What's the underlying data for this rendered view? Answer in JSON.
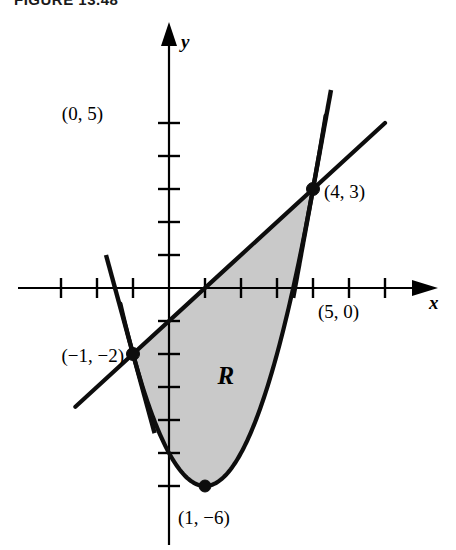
{
  "figure": {
    "caption": "FIGURE 13.48",
    "region_label": "R",
    "shade_color": "#c9c9c9",
    "ink_color": "#0d0d0d"
  },
  "axes": {
    "x_label": "x",
    "y_label": "y",
    "origin_px": [
      169,
      288
    ],
    "x_unit_px": 36,
    "y_unit_px": 33,
    "x_tick_values": [
      -3,
      -2,
      -1,
      1,
      2,
      3,
      4,
      5,
      6
    ],
    "y_tick_values": [
      1,
      2,
      3,
      4,
      5,
      -1,
      -2,
      -3,
      -4,
      -5,
      -6
    ],
    "x_arrow": true,
    "y_arrow": true,
    "grid": false
  },
  "labels": {
    "y_intercept": "(0, 5)",
    "upper_point": "(4, 3)",
    "x_intercept": "(5, 0)",
    "lower_left_point": "(−1, −2)",
    "vertex": "(1, −6)"
  },
  "chart_data": {
    "type": "line",
    "title": "FIGURE 13.48",
    "xlabel": "x",
    "ylabel": "y",
    "xlim": [
      -3.6,
      7.2
    ],
    "ylim": [
      -7.2,
      6.3
    ],
    "grid": false,
    "legend": "none",
    "series": [
      {
        "name": "parabola",
        "equation": "y = x^2 - 2x - 5",
        "vertex": [
          1,
          -6
        ],
        "x_domain": [
          -1.35,
          4.35
        ],
        "style": "solid-thick"
      },
      {
        "name": "secant-line",
        "equation": "y = x - 1",
        "through": [
          [
            -1,
            -2
          ],
          [
            4,
            3
          ]
        ],
        "slope": 1,
        "x_domain": [
          -2.6,
          6.0
        ],
        "style": "solid-thick"
      },
      {
        "name": "tangent-at-left-point",
        "equation": "y = -4x - 6",
        "tangent_at": [
          -1,
          -2
        ],
        "slope": -4,
        "x_domain": [
          -1.75,
          -0.4
        ],
        "style": "solid-thick"
      },
      {
        "name": "tangent-at-right-point",
        "equation": "y = 6x - 21",
        "tangent_at": [
          4,
          3
        ],
        "slope": 6,
        "x_domain": [
          3.45,
          4.5
        ],
        "style": "solid-thick"
      }
    ],
    "shaded_region": {
      "name": "R",
      "label": "R",
      "label_position": [
        1.35,
        -2.9
      ],
      "bounded_above_by": "y = x - 1",
      "bounded_below_by": "y = x^2 - 2x - 5",
      "x_range": [
        -1,
        4
      ],
      "fill": "#c9c9c9"
    },
    "annotations": [
      {
        "text": "(0, 5)",
        "point": [
          0,
          5
        ],
        "anchor": "left"
      },
      {
        "text": "(4, 3)",
        "point": [
          4,
          3
        ],
        "anchor": "right"
      },
      {
        "text": "(5, 0)",
        "point": [
          5,
          0
        ],
        "anchor": "below"
      },
      {
        "text": "(−1, −2)",
        "point": [
          -1,
          -2
        ],
        "anchor": "left"
      },
      {
        "text": "(1, −6)",
        "point": [
          1,
          -6
        ],
        "anchor": "below-right"
      }
    ],
    "marked_points": [
      {
        "label": "(4, 3)",
        "x": 4,
        "y": 3
      },
      {
        "label": "(−1, −2)",
        "x": -1,
        "y": -2
      },
      {
        "label": "(1, −6)",
        "x": 1,
        "y": -6
      }
    ]
  }
}
